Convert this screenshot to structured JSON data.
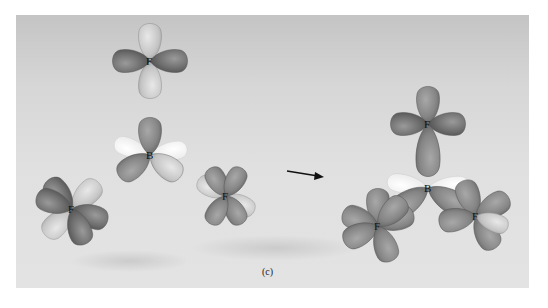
{
  "figure": {
    "caption": "(c)",
    "style": "grayscale 3D orbital rendering",
    "colors": {
      "background_top": "#c4c4c4",
      "background_bottom": "#e3e3e3",
      "lobe_dark": "#6e6e6e",
      "lobe_mid": "#8a8a8a",
      "lobe_light": "#c9c9c9",
      "lobe_white": "#f2f2f2",
      "label": "#111111"
    }
  },
  "reactants": {
    "atoms": [
      {
        "label": "F",
        "position": "top"
      },
      {
        "label": "B",
        "position": "center"
      },
      {
        "label": "F",
        "position": "bottom-left"
      },
      {
        "label": "F",
        "position": "bottom-right"
      }
    ]
  },
  "arrow": {
    "direction": "right"
  },
  "product": {
    "atoms": [
      {
        "label": "F",
        "position": "top"
      },
      {
        "label": "B",
        "position": "center"
      },
      {
        "label": "F",
        "position": "bottom-left"
      },
      {
        "label": "F",
        "position": "bottom-right"
      }
    ]
  }
}
